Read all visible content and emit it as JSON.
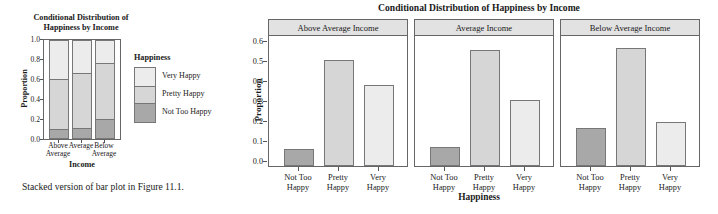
{
  "left_figure": {
    "title_line1": "Conditional Distribution of",
    "title_line2": "Happiness by Income",
    "ylabel": "Proportion",
    "xlabel": "Income",
    "yticks": [
      "1.0",
      "0.8",
      "0.6",
      "0.4",
      "0.2",
      "0.0"
    ],
    "xticklabels": [
      {
        "line1": "Above",
        "line2": "Average"
      },
      {
        "line1": "Average",
        "line2": ""
      },
      {
        "line1": "Below",
        "line2": "Average"
      }
    ],
    "legend": {
      "title": "Happiness",
      "items": [
        "Very Happy",
        "Pretty Happy",
        "Not Too Happy"
      ]
    },
    "caption": "Stacked version of bar plot in Figure 11.1."
  },
  "right_figure": {
    "title": "Conditional Distribution of Happiness by Income",
    "ylabel": "Proportion",
    "xlabel": "Happiness",
    "yticks": [
      "0.6",
      "0.5",
      "0.4",
      "0.3",
      "0.2",
      "0.1",
      "0.0"
    ],
    "strip_labels": [
      "Above Average Income",
      "Average Income",
      "Below Average Income"
    ],
    "xticklabels": [
      {
        "line1": "Not Too",
        "line2": "Happy"
      },
      {
        "line1": "Pretty",
        "line2": "Happy"
      },
      {
        "line1": "Very",
        "line2": "Happy"
      }
    ]
  },
  "colors": {
    "not_too_happy": "#a8a8a8",
    "pretty_happy": "#d6d6d6",
    "very_happy": "#ececec",
    "strip_fill": "#e2e2e2",
    "border": "#666666",
    "bar_border": "#777777"
  },
  "chart_data": [
    {
      "type": "bar",
      "title": "Conditional Distribution of Happiness by Income",
      "subtitle": "Stacked bar chart (left panel)",
      "xlabel": "Income",
      "ylabel": "Proportion",
      "ylim": [
        0.0,
        1.0
      ],
      "yticks": [
        0.0,
        0.2,
        0.4,
        0.6,
        0.8,
        1.0
      ],
      "grid": false,
      "stacked": true,
      "legend_title": "Happiness",
      "legend_position": "right",
      "categories": [
        "Above Average",
        "Average",
        "Below Average"
      ],
      "series": [
        {
          "name": "Not Too Happy",
          "values": [
            0.085,
            0.093,
            0.19
          ],
          "color": "#a8a8a8"
        },
        {
          "name": "Pretty Happy",
          "values": [
            0.525,
            0.578,
            0.588
          ],
          "color": "#d6d6d6"
        },
        {
          "name": "Very Happy",
          "values": [
            0.39,
            0.329,
            0.222
          ],
          "color": "#ececec"
        }
      ],
      "cumulative_boundaries": [
        {
          "category": "Above Average",
          "breaks": [
            0.085,
            0.61,
            1.0
          ]
        },
        {
          "category": "Average",
          "breaks": [
            0.093,
            0.671,
            1.0
          ]
        },
        {
          "category": "Below Average",
          "breaks": [
            0.19,
            0.778,
            1.0
          ]
        }
      ]
    },
    {
      "type": "bar",
      "title": "Conditional Distribution of Happiness by Income",
      "subtitle": "Grouped/faceted bar chart (right panel)",
      "xlabel": "Happiness",
      "ylabel": "Proportion",
      "ylim": [
        0.0,
        0.65
      ],
      "yticks": [
        0.0,
        0.1,
        0.2,
        0.3,
        0.4,
        0.5,
        0.6
      ],
      "grid": false,
      "legend_position": "none",
      "facet_by": "Income",
      "categories": [
        "Not Too Happy",
        "Pretty Happy",
        "Very Happy"
      ],
      "panels": [
        {
          "facet": "Above Average Income",
          "values": [
            0.085,
            0.525,
            0.4
          ]
        },
        {
          "facet": "Average Income",
          "values": [
            0.093,
            0.578,
            0.327
          ]
        },
        {
          "facet": "Below Average Income",
          "values": [
            0.19,
            0.588,
            0.218
          ]
        }
      ]
    }
  ]
}
